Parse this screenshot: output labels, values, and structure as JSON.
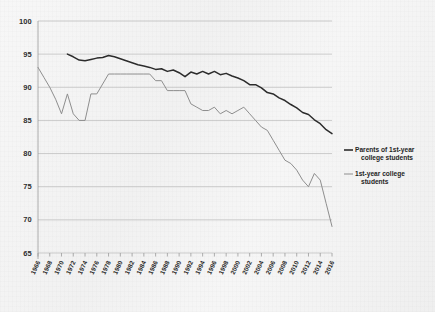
{
  "chart_data": {
    "type": "line",
    "title": "",
    "subtitle": "",
    "xlabel": "",
    "ylabel": "",
    "xlim": [
      1966,
      2016
    ],
    "ylim": [
      65,
      100
    ],
    "grid": true,
    "legend_position": "right",
    "y_ticks": [
      100,
      95,
      90,
      85,
      80,
      75,
      70,
      65
    ],
    "x_ticks": [
      1966,
      1968,
      1970,
      1972,
      1974,
      1976,
      1978,
      1980,
      1982,
      1984,
      1986,
      1988,
      1990,
      1992,
      1994,
      1996,
      1998,
      2000,
      2002,
      2004,
      2006,
      2008,
      2010,
      2012,
      2014,
      2016
    ],
    "x": [
      1966,
      1967,
      1968,
      1969,
      1970,
      1971,
      1972,
      1973,
      1974,
      1975,
      1976,
      1977,
      1978,
      1979,
      1980,
      1981,
      1982,
      1983,
      1984,
      1985,
      1986,
      1987,
      1988,
      1989,
      1990,
      1991,
      1992,
      1993,
      1994,
      1995,
      1996,
      1997,
      1998,
      1999,
      2000,
      2001,
      2002,
      2003,
      2004,
      2005,
      2006,
      2007,
      2008,
      2009,
      2010,
      2011,
      2012,
      2013,
      2014,
      2015,
      2016
    ],
    "series": [
      {
        "name": "Parents of 1st-year college students",
        "color": "#2c2c2c",
        "x": [
          1971,
          1972,
          1973,
          1974,
          1975,
          1976,
          1977,
          1978,
          1979,
          1980,
          1981,
          1982,
          1983,
          1984,
          1985,
          1986,
          1987,
          1988,
          1989,
          1990,
          1991,
          1992,
          1993,
          1994,
          1995,
          1996,
          1997,
          1998,
          1999,
          2000,
          2001,
          2002,
          2003,
          2004,
          2005,
          2006,
          2007,
          2008,
          2009,
          2010,
          2011,
          2012,
          2013,
          2014,
          2015,
          2016
        ],
        "values": [
          95.0,
          94.6,
          94.1,
          94.0,
          94.2,
          94.4,
          94.5,
          94.8,
          94.6,
          94.3,
          94.0,
          93.7,
          93.4,
          93.2,
          93.0,
          92.7,
          92.8,
          92.4,
          92.6,
          92.2,
          91.6,
          92.3,
          92.0,
          92.4,
          92.0,
          92.4,
          91.9,
          92.1,
          91.7,
          91.4,
          91.0,
          90.4,
          90.4,
          89.9,
          89.2,
          89.0,
          88.4,
          88.0,
          87.4,
          86.9,
          86.2,
          85.9,
          85.1,
          84.5,
          83.6,
          83.0
        ]
      },
      {
        "name": "1st-year college students",
        "color": "#8e8e8e",
        "x": [
          1966,
          1967,
          1968,
          1969,
          1970,
          1971,
          1972,
          1973,
          1974,
          1975,
          1976,
          1977,
          1978,
          1979,
          1980,
          1981,
          1982,
          1983,
          1984,
          1985,
          1986,
          1987,
          1988,
          1989,
          1990,
          1991,
          1992,
          1993,
          1994,
          1995,
          1996,
          1997,
          1998,
          1999,
          2000,
          2001,
          2002,
          2003,
          2004,
          2005,
          2006,
          2007,
          2008,
          2009,
          2010,
          2011,
          2012,
          2013,
          2014,
          2015,
          2016
        ],
        "values": [
          93.0,
          91.5,
          90.0,
          88.2,
          86.0,
          89.0,
          86.0,
          85.0,
          85.0,
          89.0,
          89.0,
          90.5,
          92.0,
          92.0,
          92.0,
          92.0,
          92.0,
          92.0,
          92.0,
          92.0,
          91.0,
          91.0,
          89.5,
          89.5,
          89.5,
          89.5,
          87.5,
          87.0,
          86.5,
          86.5,
          87.0,
          86.0,
          86.5,
          86.0,
          86.5,
          87.0,
          86.0,
          85.0,
          84.0,
          83.5,
          82.0,
          80.5,
          79.0,
          78.5,
          77.5,
          76.0,
          75.0,
          77.0,
          76.0,
          72.5,
          69.0
        ]
      }
    ]
  },
  "legend": {
    "entries": [
      {
        "label_line1": "Parents of 1st-year",
        "label_line2": "college students",
        "color": "#2c2c2c"
      },
      {
        "label_line1": "1st-year college",
        "label_line2": "students",
        "color": "#8e8e8e"
      }
    ]
  }
}
